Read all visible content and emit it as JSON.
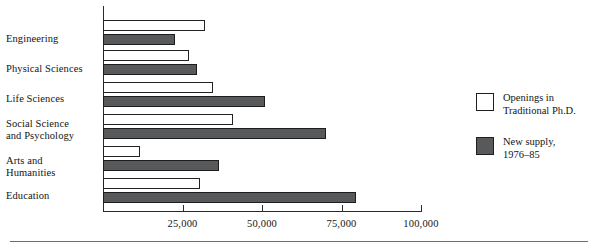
{
  "chart_data": {
    "type": "bar",
    "orientation": "horizontal",
    "title": "",
    "xlabel": "",
    "ylabel": "",
    "xlim": [
      0,
      100000
    ],
    "grid": false,
    "legend_position": "right",
    "tick_labels": [
      "25,000",
      "50,000",
      "75,000",
      "100,000"
    ],
    "tick_values": [
      25000,
      50000,
      75000,
      100000
    ],
    "categories": [
      "Engineering",
      "Physical Sciences",
      "Life Sciences",
      "Social Science and Psychology",
      "Arts and Humanities",
      "Education"
    ],
    "category_lines": [
      [
        "Engineering"
      ],
      [
        "Physical Sciences"
      ],
      [
        "Life Sciences"
      ],
      [
        "Social Science",
        "and Psychology"
      ],
      [
        "Arts and",
        "Humanities"
      ],
      [
        "Education"
      ]
    ],
    "series": [
      {
        "name": "Openings in Traditional Ph.D.",
        "style": "open",
        "color": "#ffffff",
        "values": [
          32000,
          27000,
          34500,
          41000,
          11500,
          30500
        ]
      },
      {
        "name": "New supply, 1976-85",
        "style": "filled",
        "color": "#58595b",
        "values": [
          22500,
          29500,
          51000,
          70000,
          36500,
          79500
        ]
      }
    ]
  },
  "legend": {
    "entries": [
      {
        "style": "open",
        "line1": "Openings in",
        "line2": "Traditional Ph.D."
      },
      {
        "style": "filled",
        "line1": "New supply,",
        "line2": "1976–85"
      }
    ]
  }
}
